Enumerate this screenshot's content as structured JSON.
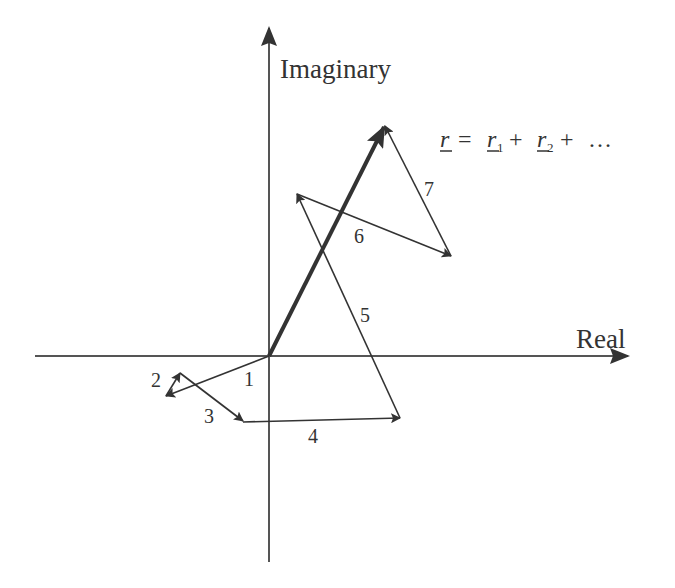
{
  "diagram": {
    "axes": {
      "real_label": "Real",
      "imaginary_label": "Imaginary"
    },
    "formula": {
      "lhs": "r",
      "equals": "=",
      "term1": "r",
      "term1_sub": "1",
      "plus1": "+",
      "term2": "r",
      "term2_sub": "2",
      "plus2": "+",
      "ellipsis": "…"
    },
    "vectors": [
      {
        "label": "1"
      },
      {
        "label": "2"
      },
      {
        "label": "3"
      },
      {
        "label": "4"
      },
      {
        "label": "5"
      },
      {
        "label": "6"
      },
      {
        "label": "7"
      }
    ],
    "colors": {
      "line": "#333333",
      "resultant": "#333333",
      "background": "#ffffff"
    }
  }
}
